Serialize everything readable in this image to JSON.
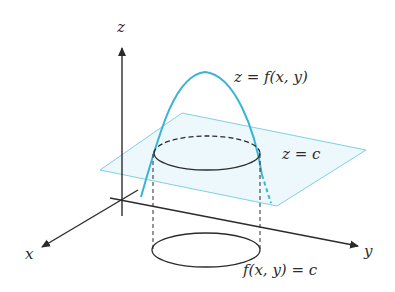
{
  "diagram": {
    "type": "level-curve-illustration",
    "colors": {
      "curve": "#3bb3d6",
      "plane_fill": "#e6f6fb",
      "plane_edge": "#7fd0e6",
      "axis": "#2b2b2b"
    },
    "labels": {
      "z_axis": "z",
      "x_axis": "x",
      "y_axis": "y",
      "surface": "z = f(x, y)",
      "plane": "z = c",
      "level_curve": "f(x, y) = c"
    }
  }
}
